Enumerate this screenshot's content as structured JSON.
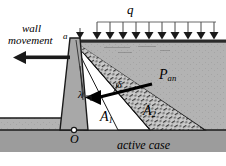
{
  "figure": {
    "caption": "active case",
    "surcharge_label": "q",
    "wall_movement_label_line1": "wall",
    "wall_movement_label_line2": "movement",
    "apex_label": "a",
    "origin_label": "O",
    "wedge1_label": "A",
    "wedge1_sub": "1",
    "wedge2_label": "A",
    "wedge2_sub": "2",
    "force_label": "P",
    "force_sub": "an",
    "angle_delta_label": "δ",
    "angle_lambda_label": "λ",
    "surcharge_arrow_count": 10
  },
  "colors": {
    "soil_fill": "#b3b3b3",
    "soil_dark": "#9a9a9a",
    "wall_fill": "#a8a8a8",
    "wedge_white": "#ffffff",
    "hatch_fill": "#c9c9c9",
    "line": "#1a1a1a",
    "ground_band": "#8f8f8f",
    "page": "#ffffff"
  }
}
